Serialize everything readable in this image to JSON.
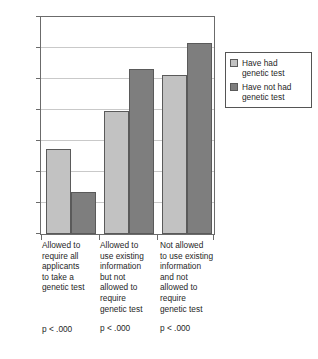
{
  "chart_data": {
    "type": "bar",
    "title": "",
    "xlabel": "",
    "ylabel": "",
    "ylim": [
      0,
      70
    ],
    "ytick_values": [
      0,
      10,
      20,
      30,
      40,
      50,
      60,
      70
    ],
    "ytick_labels": [
      "0",
      "10",
      "20",
      "30",
      "40",
      "50",
      "60",
      "70"
    ],
    "grid": true,
    "legend_position": "right",
    "categories": [
      "Allowed to require all applicants to take a genetic test",
      "Allowed to use existing information but not allowed to require genetic test",
      "Not allowed to use existing information and not allowed to require genetic test"
    ],
    "category_lines": [
      [
        "Allowed to",
        "require all",
        "applicants",
        "to take a",
        "genetic test"
      ],
      [
        "Allowed to",
        "use existing",
        "information",
        "but not",
        "allowed to",
        "require",
        "genetic test"
      ],
      [
        "Not allowed",
        "to use existing",
        "information",
        "and not",
        "allowed  to",
        "require",
        "genetic test"
      ]
    ],
    "annotations": [
      "p < .000",
      "p < .000",
      "p < .000"
    ],
    "series": [
      {
        "name": "Have had genetic test",
        "color": "#c2c2c2",
        "values": [
          27.3,
          39.8,
          51.2
        ]
      },
      {
        "name": "Have not had genetic test",
        "color": "#7e7e7e",
        "values": [
          13.7,
          53.2,
          61.7
        ]
      }
    ]
  },
  "legend": {
    "items": [
      {
        "line1": "Have had",
        "line2": "genetic test",
        "swatch": "light"
      },
      {
        "line1": "Have not had",
        "line2": "genetic test",
        "swatch": "dark"
      }
    ]
  },
  "axis": {
    "t70": "70",
    "t60": "60",
    "t50": "50",
    "t40": "40",
    "t30": "30",
    "t20": "20",
    "t10": "10",
    "t0": "0"
  },
  "xlabels": [
    {
      "l1": "Allowed to",
      "l2": "require all",
      "l3": "applicants",
      "l4": "to take a",
      "l5": "genetic test",
      "l6": "",
      "l7": "",
      "p": "p < .000"
    },
    {
      "l1": "Allowed to",
      "l2": "use existing",
      "l3": "information",
      "l4": "but not",
      "l5": "allowed to",
      "l6": "require",
      "l7": "genetic test",
      "p": "p < .000"
    },
    {
      "l1": "Not allowed",
      "l2": "to use existing",
      "l3": "information",
      "l4": "and not",
      "l5": "allowed  to",
      "l6": "require",
      "l7": "genetic test",
      "p": "p < .000"
    }
  ],
  "colors": {
    "series_light": "#c2c2c2",
    "series_dark": "#7e7e7e",
    "frame": "#6b6b6b",
    "grid": "#c9c9c9"
  }
}
